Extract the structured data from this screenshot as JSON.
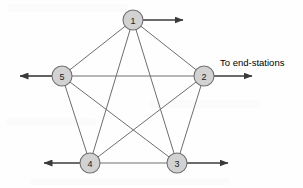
{
  "diagram": {
    "type": "network-topology",
    "background_color": "#fefefe",
    "node_fill_color": "#d2d2d2",
    "node_stroke_color": "#707070",
    "edge_color": "#6e6e6e",
    "trunk_color": "#3a3a3a",
    "label_color": "#111111"
  },
  "nodes": [
    {
      "id": "1",
      "label": "1",
      "cx": 133,
      "cy": 20,
      "r": 10
    },
    {
      "id": "2",
      "label": "2",
      "cx": 204,
      "cy": 76,
      "r": 10
    },
    {
      "id": "3",
      "label": "3",
      "cx": 177,
      "cy": 163,
      "r": 10
    },
    {
      "id": "4",
      "label": "4",
      "cx": 90,
      "cy": 163,
      "r": 10
    },
    {
      "id": "5",
      "label": "5",
      "cx": 62,
      "cy": 76,
      "r": 10
    }
  ],
  "edges": [
    {
      "from": "1",
      "to": "2"
    },
    {
      "from": "1",
      "to": "3"
    },
    {
      "from": "1",
      "to": "4"
    },
    {
      "from": "1",
      "to": "5"
    },
    {
      "from": "2",
      "to": "3"
    },
    {
      "from": "2",
      "to": "4"
    },
    {
      "from": "2",
      "to": "5"
    },
    {
      "from": "3",
      "to": "4"
    },
    {
      "from": "3",
      "to": "5"
    },
    {
      "from": "4",
      "to": "5"
    }
  ],
  "trunks": [
    {
      "id": "trunk-node-1-right",
      "from_node": "1",
      "direction": "right",
      "x1": 143,
      "y1": 20,
      "x2": 183,
      "y2": 20
    },
    {
      "id": "trunk-node-5-left",
      "from_node": "5",
      "direction": "left",
      "x1": 52,
      "y1": 76,
      "x2": 20,
      "y2": 76
    },
    {
      "id": "trunk-node-2-right",
      "from_node": "2",
      "direction": "right",
      "x1": 214,
      "y1": 76,
      "x2": 252,
      "y2": 76
    },
    {
      "id": "trunk-node-4-left",
      "from_node": "4",
      "direction": "left",
      "x1": 80,
      "y1": 163,
      "x2": 44,
      "y2": 163
    },
    {
      "id": "trunk-node-3-right",
      "from_node": "3",
      "direction": "right",
      "x1": 187,
      "y1": 163,
      "x2": 228,
      "y2": 163
    }
  ],
  "labels": {
    "end_stations": "To end-stations"
  }
}
